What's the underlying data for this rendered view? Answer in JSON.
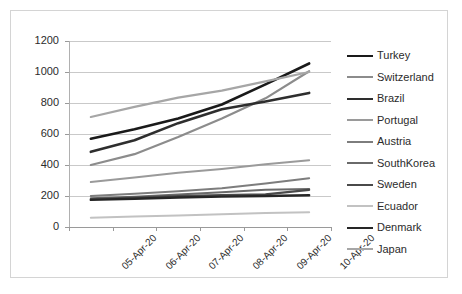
{
  "chart_data": {
    "type": "line",
    "title": "",
    "xlabel": "",
    "ylabel": "",
    "ylim": [
      0,
      1200
    ],
    "y_ticks": [
      0,
      200,
      400,
      600,
      800,
      1000,
      1200
    ],
    "grid": true,
    "legend_position": "right",
    "categories": [
      "05-Apr-20",
      "06-Apr-20",
      "07-Apr-20",
      "08-Apr-20",
      "09-Apr-20",
      "10-Apr-20"
    ],
    "series": [
      {
        "name": "Turkey",
        "color": "#1a1a1a",
        "width": 2.6,
        "values": [
          570,
          630,
          700,
          790,
          920,
          1055
        ]
      },
      {
        "name": "Switzerland",
        "color": "#8c8c8c",
        "width": 2.2,
        "values": [
          400,
          470,
          580,
          700,
          830,
          1005
        ]
      },
      {
        "name": "Brazil",
        "color": "#2e2e2e",
        "width": 2.6,
        "values": [
          485,
          560,
          670,
          760,
          810,
          865
        ]
      },
      {
        "name": "Portugal",
        "color": "#9a9a9a",
        "width": 2.0,
        "values": [
          290,
          320,
          350,
          375,
          405,
          430
        ]
      },
      {
        "name": "Austria",
        "color": "#7d7d7d",
        "width": 2.0,
        "values": [
          200,
          215,
          230,
          250,
          280,
          315
        ]
      },
      {
        "name": "SouthKorea",
        "color": "#6a6a6a",
        "width": 2.0,
        "values": [
          185,
          195,
          210,
          225,
          240,
          245
        ]
      },
      {
        "name": "Sweden",
        "color": "#4a4a4a",
        "width": 2.2,
        "values": [
          180,
          190,
          200,
          205,
          210,
          240
        ]
      },
      {
        "name": "Ecuador",
        "color": "#c2c2c2",
        "width": 2.0,
        "values": [
          60,
          68,
          75,
          82,
          90,
          95
        ]
      },
      {
        "name": "Denmark",
        "color": "#262626",
        "width": 2.4,
        "values": [
          175,
          182,
          190,
          196,
          200,
          205
        ]
      },
      {
        "name": "Japan",
        "color": "#a6a6a6",
        "width": 2.2,
        "values": [
          710,
          775,
          835,
          880,
          940,
          1000
        ]
      }
    ]
  },
  "legend": {
    "items": [
      {
        "label": "Turkey"
      },
      {
        "label": "Switzerland"
      },
      {
        "label": "Brazil"
      },
      {
        "label": "Portugal"
      },
      {
        "label": "Austria"
      },
      {
        "label": "SouthKorea"
      },
      {
        "label": "Sweden"
      },
      {
        "label": "Ecuador"
      },
      {
        "label": "Denmark"
      },
      {
        "label": "Japan"
      }
    ]
  },
  "axis": {
    "y_tick_labels": [
      "1200",
      "1000",
      "800",
      "600",
      "400",
      "200",
      "0"
    ],
    "x_tick_labels": [
      "05-Apr-20",
      "06-Apr-20",
      "07-Apr-20",
      "08-Apr-20",
      "09-Apr-20",
      "10-Apr-20"
    ]
  }
}
